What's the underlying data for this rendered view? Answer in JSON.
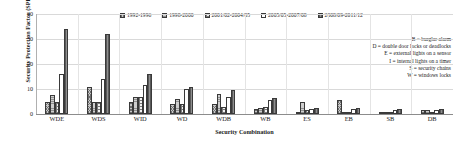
{
  "chart_data": {
    "type": "bar",
    "title": "",
    "xlabel": "Security Combination",
    "ylabel": "Security Protection Factor (SPF)",
    "ylim": [
      0,
      40
    ],
    "yticks": [
      0,
      10,
      20,
      30,
      40
    ],
    "grid": true,
    "legend_position": "top",
    "categories": [
      "WDE",
      "WDS",
      "WID",
      "WD",
      "WDB",
      "WB",
      "ES",
      "EB",
      "SB",
      "DB"
    ],
    "series": [
      {
        "name": "1992-1996",
        "values": [
          5.0,
          11.0,
          5.0,
          4.0,
          4.0,
          2.0,
          1.0,
          5.5,
          0.5,
          1.5
        ]
      },
      {
        "name": "1998-2000",
        "values": [
          7.5,
          5.0,
          7.0,
          6.0,
          8.0,
          2.5,
          5.0,
          1.0,
          0.5,
          1.5
        ]
      },
      {
        "name": "2001/02-2004/05",
        "values": [
          5.0,
          5.0,
          7.0,
          4.0,
          3.0,
          3.0,
          1.5,
          1.0,
          0.5,
          0.5
        ]
      },
      {
        "name": "2005/05-2007/08",
        "values": [
          16.0,
          14.0,
          11.5,
          10.0,
          7.0,
          5.5,
          2.0,
          2.0,
          1.5,
          1.5
        ]
      },
      {
        "name": "2008/09-2011/12",
        "values": [
          34.0,
          32.0,
          16.0,
          11.0,
          9.5,
          6.5,
          2.5,
          2.5,
          2.0,
          2.0
        ]
      }
    ],
    "annotations": [
      "B = burglar alarm",
      "D = double door locks or deadlocks",
      "E = external lights on a sensor",
      "I = internal lights on a timer",
      "S = security chains",
      "W = windows locks"
    ]
  },
  "colors": {
    "series": [
      "#c8c8c8",
      "#cfcfcf",
      "#f2f2f2",
      "#ffffff",
      "#8e8e8e"
    ],
    "gridline": "#d9d9d9",
    "axis": "#8c8c8c",
    "text": "#1a1a1a"
  }
}
